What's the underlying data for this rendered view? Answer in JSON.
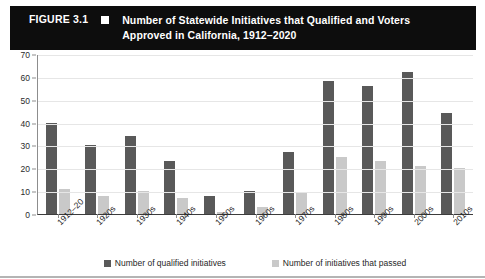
{
  "header": {
    "figure_label": "FIGURE 3.1",
    "bullet_icon": "filled-square-icon",
    "title": "Number of Statewide Initiatives that Qualified and Voters Approved in California, 1912–2020",
    "background_color": "#0d0d0d",
    "text_color": "#ffffff"
  },
  "legend": {
    "items": [
      {
        "label": "Number of qualified initiatives",
        "color": "#595959"
      },
      {
        "label": "Number of initiatives that passed",
        "color": "#c9c9c9"
      }
    ]
  },
  "chart_data": {
    "type": "bar",
    "title": "Number of Statewide Initiatives that Qualified and Voters Approved in California, 1912–2020",
    "xlabel": "",
    "ylabel": "",
    "ylim": [
      0,
      70
    ],
    "yticks": [
      0,
      10,
      20,
      30,
      40,
      50,
      60,
      70
    ],
    "grid": true,
    "legend_position": "bottom",
    "categories": [
      "1912–20",
      "1920s",
      "1930s",
      "1940s",
      "1950s",
      "1960s",
      "1970s",
      "1980s",
      "1990s",
      "2000s",
      "2010s"
    ],
    "series": [
      {
        "name": "Number of qualified initiatives",
        "color": "#595959",
        "values": [
          40,
          30,
          34,
          23,
          8,
          10,
          27,
          58,
          56,
          62,
          44
        ]
      },
      {
        "name": "Number of initiatives that passed",
        "color": "#c9c9c9",
        "values": [
          11,
          8,
          10,
          7,
          1,
          3,
          9,
          25,
          23,
          21,
          20
        ]
      }
    ]
  }
}
